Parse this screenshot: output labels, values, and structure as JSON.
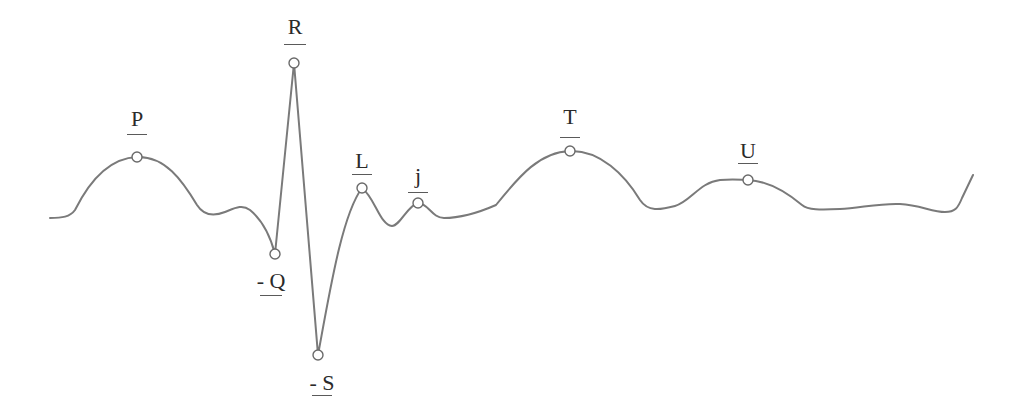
{
  "diagram": {
    "type": "ecg-waveform",
    "stroke_color": "#7a7a7a",
    "background": "#ffffff",
    "points": [
      {
        "id": "P",
        "label": "P",
        "x": 137,
        "y": 157,
        "label_x": 137,
        "label_y": 108,
        "underline_y": 134,
        "underline_w": 20
      },
      {
        "id": "R",
        "label": "R",
        "x": 294,
        "y": 63,
        "label_x": 295,
        "label_y": 16,
        "underline_y": 44,
        "underline_w": 22
      },
      {
        "id": "Q",
        "label": "- Q",
        "x": 275,
        "y": 254,
        "label_x": 271,
        "label_y": 270,
        "underline_y": 295,
        "underline_w": 22
      },
      {
        "id": "S",
        "label": "- S",
        "x": 318,
        "y": 355,
        "label_x": 322,
        "label_y": 372,
        "underline_y": 395,
        "underline_w": 20
      },
      {
        "id": "L",
        "label": "L",
        "x": 362,
        "y": 188,
        "label_x": 362,
        "label_y": 150,
        "underline_y": 174,
        "underline_w": 20
      },
      {
        "id": "j",
        "label": "j",
        "x": 418,
        "y": 203,
        "label_x": 418,
        "label_y": 165,
        "underline_y": 192,
        "underline_w": 20
      },
      {
        "id": "T",
        "label": "T",
        "x": 570,
        "y": 151,
        "label_x": 570,
        "label_y": 106,
        "underline_y": 137,
        "underline_w": 20
      },
      {
        "id": "U",
        "label": "U",
        "x": 748,
        "y": 180,
        "label_x": 748,
        "label_y": 140,
        "underline_y": 163,
        "underline_w": 20
      }
    ],
    "path": "M50,218 C62,218 70,217 75,210 C90,180 110,158 137,157 C165,156 182,180 197,205 C204,216 215,216 225,212 C235,208 242,204 250,210 C262,220 270,235 275,254 L294,63 L318,355 C330,290 342,215 362,188 C375,198 380,225 392,226 C400,226 408,205 418,203 C428,203 432,218 444,218 C460,218 480,212 496,205 C520,175 540,152 570,151 C600,150 625,175 640,200 C648,212 660,210 675,206 C690,202 700,182 720,180 C735,179 742,180 748,180 C770,181 790,195 802,205 C808,210 820,210 840,209 C860,208 880,203 900,204 C920,205 932,212 945,212 C955,212 958,208 962,198 L973,175"
  }
}
